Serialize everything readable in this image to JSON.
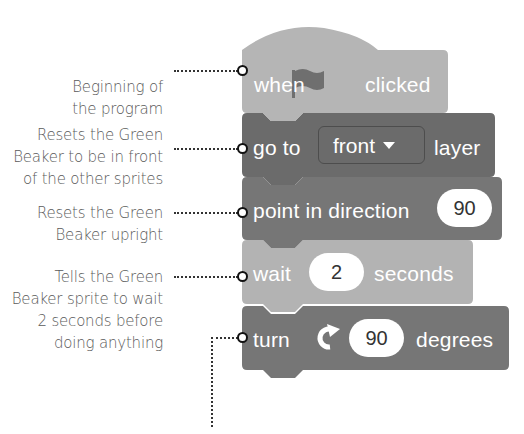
{
  "annotations": [
    {
      "id": "beginning",
      "lines": [
        "Beginning of",
        "the program"
      ]
    },
    {
      "id": "front",
      "lines": [
        "Resets the Green",
        "Beaker to be in front",
        "of the other sprites"
      ]
    },
    {
      "id": "upright",
      "lines": [
        "Resets the Green",
        "Beaker upright"
      ]
    },
    {
      "id": "wait",
      "lines": [
        "Tells the Green",
        "Beaker sprite to wait",
        "2 seconds before",
        "doing anything"
      ]
    }
  ],
  "blocks": [
    {
      "type": "hat",
      "words": [
        "when",
        "clicked"
      ],
      "icon": "green-flag-icon",
      "color": "#b5b5b5"
    },
    {
      "type": "looks",
      "words": [
        "go to",
        "layer"
      ],
      "dropdown": "front",
      "color": "#6e6e6e"
    },
    {
      "type": "motion",
      "words": [
        "point in direction"
      ],
      "input": "90",
      "color": "#767676"
    },
    {
      "type": "control",
      "words": [
        "wait",
        "seconds"
      ],
      "input": "2",
      "color": "#b3b3b3"
    },
    {
      "type": "motion",
      "words": [
        "turn",
        "degrees"
      ],
      "icon": "rotate-clockwise-icon",
      "input": "90",
      "color": "#767676"
    }
  ],
  "colors": {
    "label_text": "#5a5a5a",
    "leader_line": "#333333",
    "block_text": "#ffffff"
  }
}
